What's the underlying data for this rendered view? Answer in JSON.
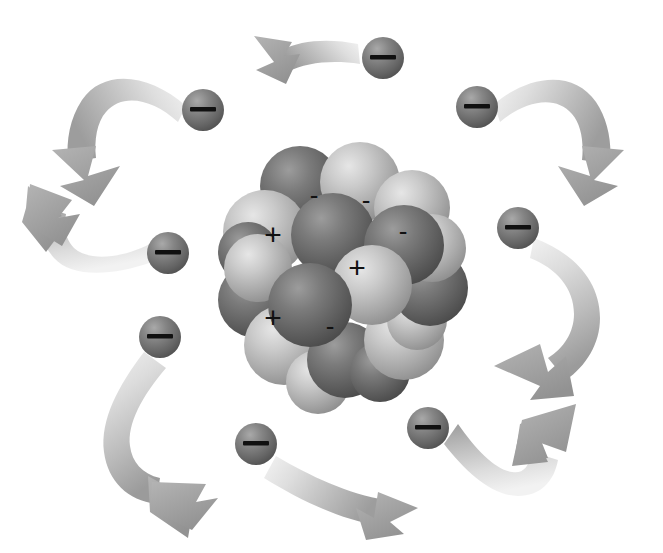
{
  "figure": {
    "title": "Atom diagram: nucleus of protons and neutrons with orbiting electrons",
    "background_color": "#ffffff",
    "width": 663,
    "height": 553
  },
  "legend": {
    "proton_symbol": "+",
    "neutron_symbol": "-",
    "electron_symbol": "—",
    "proton_label": "proton",
    "neutron_label": "neutron",
    "electron_label": "electron"
  },
  "colors": {
    "proton_light": "#cfcfcf",
    "proton_mid": "#a8a8a8",
    "proton_dark": "#8f8f8f",
    "neutron_light": "#8c8c8c",
    "neutron_mid": "#6e6e6e",
    "neutron_dark": "#4f4f4f",
    "electron_light": "#9a9a9a",
    "electron_mid": "#777777",
    "electron_dark": "#545454",
    "arrow_light": "#ededed",
    "arrow_mid": "#bcbcbc",
    "arrow_dark": "#8e8e8e",
    "charge_mark": "#111111",
    "background": "#ffffff"
  },
  "nucleus": {
    "center_x": 342,
    "center_y": 265,
    "radius": 112,
    "proton_count": 3,
    "neutron_count": 4,
    "sphere_radius": 38,
    "charge_marks": [
      {
        "symbol": "+",
        "x": 273,
        "y": 234
      },
      {
        "symbol": "+",
        "x": 357,
        "y": 267
      },
      {
        "symbol": "+",
        "x": 273,
        "y": 317
      },
      {
        "symbol": "-",
        "x": 314,
        "y": 195
      },
      {
        "symbol": "-",
        "x": 366,
        "y": 200
      },
      {
        "symbol": "-",
        "x": 403,
        "y": 231
      },
      {
        "symbol": "-",
        "x": 330,
        "y": 326
      }
    ],
    "spheres": [
      {
        "type": "neutron",
        "x": 300,
        "y": 186,
        "r": 40
      },
      {
        "type": "proton",
        "x": 360,
        "y": 182,
        "r": 40
      },
      {
        "type": "proton",
        "x": 412,
        "y": 208,
        "r": 38
      },
      {
        "type": "proton",
        "x": 265,
        "y": 232,
        "r": 42
      },
      {
        "type": "neutron",
        "x": 256,
        "y": 300,
        "r": 38
      },
      {
        "type": "proton",
        "x": 284,
        "y": 345,
        "r": 40
      },
      {
        "type": "neutron",
        "x": 345,
        "y": 360,
        "r": 38
      },
      {
        "type": "proton",
        "x": 404,
        "y": 340,
        "r": 40
      },
      {
        "type": "neutron",
        "x": 430,
        "y": 288,
        "r": 38
      },
      {
        "type": "proton",
        "x": 432,
        "y": 248,
        "r": 34
      },
      {
        "type": "neutron",
        "x": 333,
        "y": 235,
        "r": 42
      },
      {
        "type": "neutron",
        "x": 404,
        "y": 245,
        "r": 40
      },
      {
        "type": "proton",
        "x": 372,
        "y": 285,
        "r": 40
      },
      {
        "type": "neutron",
        "x": 310,
        "y": 305,
        "r": 42
      },
      {
        "type": "proton",
        "x": 258,
        "y": 268,
        "r": 34
      },
      {
        "type": "neutron",
        "x": 248,
        "y": 252,
        "r": 30
      },
      {
        "type": "proton",
        "x": 318,
        "y": 382,
        "r": 32
      },
      {
        "type": "neutron",
        "x": 380,
        "y": 372,
        "r": 30
      },
      {
        "type": "proton",
        "x": 417,
        "y": 320,
        "r": 30
      }
    ]
  },
  "electrons": [
    {
      "id": "electron-top-left",
      "x": 203,
      "y": 110,
      "r": 21
    },
    {
      "id": "electron-top-center",
      "x": 383,
      "y": 58,
      "r": 21
    },
    {
      "id": "electron-top-right",
      "x": 477,
      "y": 107,
      "r": 21
    },
    {
      "id": "electron-left",
      "x": 168,
      "y": 253,
      "r": 21
    },
    {
      "id": "electron-right",
      "x": 518,
      "y": 228,
      "r": 21
    },
    {
      "id": "electron-lower-left",
      "x": 160,
      "y": 337,
      "r": 21
    },
    {
      "id": "electron-bottom",
      "x": 256,
      "y": 444,
      "r": 21
    },
    {
      "id": "electron-bottom-right",
      "x": 428,
      "y": 428,
      "r": 21
    }
  ],
  "arrows": [
    {
      "id": "arrow-top-left",
      "direction": "counterclockwise",
      "description": "curves left and down, arrowhead pointing down-left"
    },
    {
      "id": "arrow-top-center",
      "direction": "counterclockwise",
      "description": "short ribbon, arrowhead pointing left"
    },
    {
      "id": "arrow-top-right",
      "direction": "clockwise",
      "description": "curves right and down, arrowhead pointing down"
    },
    {
      "id": "arrow-left",
      "direction": "counterclockwise",
      "description": "curves up and left, arrowhead pointing up-left"
    },
    {
      "id": "arrow-right",
      "direction": "clockwise",
      "description": "curves down and left, arrowhead pointing down-left"
    },
    {
      "id": "arrow-lower-left",
      "direction": "clockwise",
      "description": "curves down then right, arrowhead pointing right"
    },
    {
      "id": "arrow-bottom",
      "direction": "clockwise",
      "description": "curves right and down, arrowhead pointing down-right"
    },
    {
      "id": "arrow-bottom-right",
      "direction": "counterclockwise",
      "description": "curves down then up, arrowhead pointing up-right"
    }
  ]
}
